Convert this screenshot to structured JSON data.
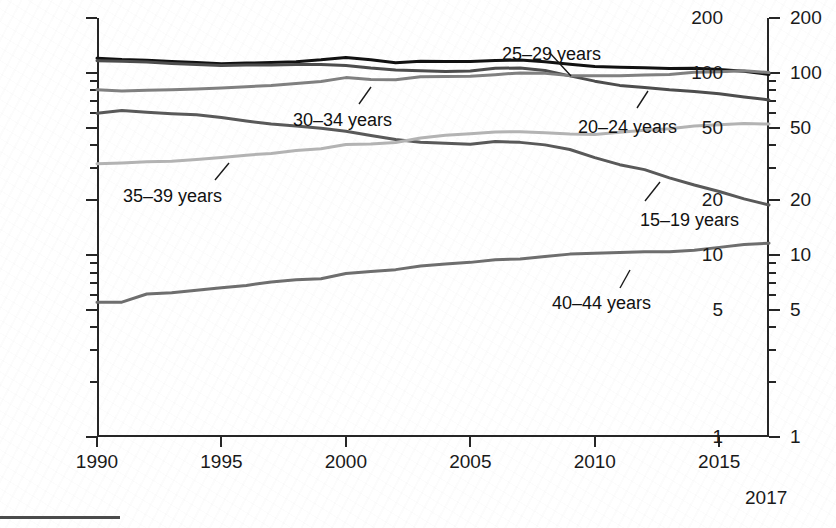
{
  "chart_data": {
    "type": "line",
    "title": "",
    "subtitle": "",
    "xlabel": "",
    "ylabel": "Rate per 1,000 women",
    "yscale": "log",
    "ylim": [
      1,
      200
    ],
    "xlim": [
      1990,
      2017
    ],
    "grid": false,
    "legend_position": "inline-annotations",
    "y_ticks_major": [
      200,
      100,
      50,
      20,
      10,
      5,
      1
    ],
    "y_tick_labels": [
      "200",
      "100",
      "50",
      "20",
      "10",
      "5",
      "1"
    ],
    "y_ticks_minor": [
      90,
      80,
      70,
      60,
      40,
      30,
      9,
      8,
      7,
      6,
      4,
      3,
      2
    ],
    "x_ticks": [
      1990,
      1995,
      2000,
      2005,
      2010,
      2015
    ],
    "x_tick_labels": [
      "1990",
      "1995",
      "2000",
      "2005",
      "2010",
      "2015"
    ],
    "x_end_label": "2017",
    "x": [
      1990,
      1991,
      1992,
      1993,
      1994,
      1995,
      1996,
      1997,
      1998,
      1999,
      2000,
      2001,
      2002,
      2003,
      2004,
      2005,
      2006,
      2007,
      2008,
      2009,
      2010,
      2011,
      2012,
      2013,
      2014,
      2015,
      2016,
      2017
    ],
    "series": [
      {
        "name": "25-29 years",
        "label": "25–29 years",
        "color": "#111111",
        "width": 3.0,
        "values": [
          120.2,
          118.2,
          117.4,
          115.5,
          113.9,
          112.2,
          113.1,
          113.8,
          115.2,
          117.8,
          121.4,
          118.0,
          113.6,
          115.6,
          115.5,
          115.5,
          116.7,
          117.5,
          115.1,
          111.5,
          108.3,
          107.2,
          106.5,
          105.5,
          105.8,
          104.3,
          101.9,
          98.0
        ]
      },
      {
        "name": "20-24 years",
        "label": "20–24 years",
        "color": "#4d4d4d",
        "width": 3.0,
        "values": [
          116.5,
          115.7,
          114.6,
          112.6,
          111.1,
          109.8,
          110.4,
          110.4,
          111.2,
          111.0,
          109.7,
          106.2,
          103.6,
          102.6,
          101.7,
          102.2,
          105.9,
          106.3,
          103.0,
          96.2,
          90.0,
          85.3,
          83.1,
          80.7,
          79.0,
          76.8,
          73.7,
          71.0
        ]
      },
      {
        "name": "30-34 years",
        "label": "30–34 years",
        "color": "#808080",
        "width": 3.0,
        "values": [
          80.8,
          79.5,
          80.2,
          80.8,
          81.5,
          82.5,
          83.9,
          85.3,
          87.4,
          89.6,
          94.1,
          91.9,
          91.5,
          95.1,
          95.3,
          95.8,
          97.7,
          99.9,
          99.3,
          96.5,
          96.5,
          96.5,
          97.3,
          98.0,
          100.8,
          101.5,
          102.7,
          100.3
        ]
      },
      {
        "name": "15-19 years",
        "label": "15–19 years",
        "color": "#595959",
        "width": 3.0,
        "values": [
          59.9,
          62.1,
          60.7,
          59.6,
          58.9,
          56.8,
          54.4,
          52.3,
          51.1,
          49.6,
          47.7,
          45.3,
          43.0,
          41.6,
          41.1,
          40.5,
          41.9,
          41.5,
          40.2,
          37.9,
          34.2,
          31.3,
          29.4,
          26.5,
          24.2,
          22.3,
          20.3,
          18.8
        ]
      },
      {
        "name": "35-39 years",
        "label": "35–39 years",
        "color": "#b3b3b3",
        "width": 3.0,
        "values": [
          31.7,
          32.0,
          32.5,
          32.7,
          33.4,
          34.3,
          35.3,
          36.1,
          37.4,
          38.3,
          40.4,
          40.6,
          41.4,
          43.8,
          45.4,
          46.3,
          47.3,
          47.5,
          46.9,
          46.1,
          45.9,
          47.2,
          48.3,
          49.3,
          51.0,
          51.8,
          52.7,
          52.3
        ]
      },
      {
        "name": "40-44 years",
        "label": "40–44 years",
        "color": "#6e6e6e",
        "width": 3.0,
        "values": [
          5.5,
          5.5,
          6.1,
          6.2,
          6.4,
          6.6,
          6.8,
          7.1,
          7.3,
          7.4,
          7.9,
          8.1,
          8.3,
          8.7,
          8.9,
          9.1,
          9.4,
          9.5,
          9.8,
          10.1,
          10.2,
          10.3,
          10.4,
          10.4,
          10.6,
          11.0,
          11.4,
          11.6
        ]
      }
    ],
    "annotations": [
      {
        "name": "annotation-25-29",
        "text": "25–29 years",
        "x_px": 502,
        "y_px": 44,
        "leader": {
          "x1": 549,
          "y1": 52,
          "x2": 571,
          "y2": 76
        }
      },
      {
        "name": "annotation-30-34",
        "text": "30–34 years",
        "x_px": 293,
        "y_px": 110,
        "leader": {
          "x1": 359,
          "y1": 104,
          "x2": 371,
          "y2": 87
        }
      },
      {
        "name": "annotation-20-24",
        "text": "20–24 years",
        "x_px": 578,
        "y_px": 117,
        "leader": {
          "x1": 637,
          "y1": 108,
          "x2": 648,
          "y2": 91
        }
      },
      {
        "name": "annotation-35-39",
        "text": "35–39 years",
        "x_px": 123,
        "y_px": 186,
        "leader": {
          "x1": 215,
          "y1": 180,
          "x2": 229,
          "y2": 163
        }
      },
      {
        "name": "annotation-15-19",
        "text": "15–19 years",
        "x_px": 640,
        "y_px": 210,
        "leader": {
          "x1": 645,
          "y1": 201,
          "x2": 660,
          "y2": 182
        }
      },
      {
        "name": "annotation-40-44",
        "text": "40–44 years",
        "x_px": 552,
        "y_px": 293,
        "leader": {
          "x1": 620,
          "y1": 288,
          "x2": 630,
          "y2": 270
        }
      }
    ]
  },
  "axes": {
    "y_title": "Rate per 1,000 women",
    "y_labels_left": [
      "200",
      "100",
      "50",
      "20",
      "10",
      "5",
      "1"
    ],
    "y_labels_right": [
      "200",
      "100",
      "50",
      "20",
      "10",
      "5",
      "1"
    ],
    "x_labels": [
      "1990",
      "1995",
      "2000",
      "2005",
      "2010",
      "2015"
    ],
    "x_end_label": "2017"
  }
}
